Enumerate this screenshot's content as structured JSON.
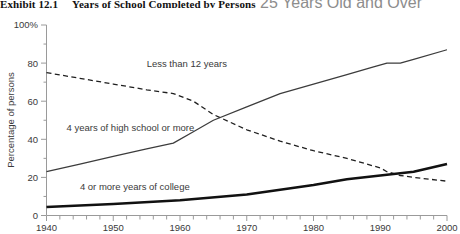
{
  "title": {
    "exhibit_number": "Exhibit 12.1",
    "text": "Years of School Completed by Persons",
    "tail": "25 Years Old and Over"
  },
  "chart_data": {
    "type": "line",
    "title": "Years of School Completed by Persons 25 Years Old and Over",
    "xlabel": "",
    "ylabel": "Percentage of persons",
    "xlim": [
      1940,
      2000
    ],
    "ylim": [
      0,
      100
    ],
    "grid": false,
    "legend_position": "inline-annotations",
    "x_tick_labels": [
      "1940",
      "1950",
      "1960",
      "1970",
      "1980",
      "1990",
      "2000"
    ],
    "x_major_ticks": [
      1940,
      1950,
      1960,
      1970,
      1980,
      1990,
      2000
    ],
    "x_minor_tick_interval": 2,
    "y_tick_labels": [
      "0",
      "20",
      "40",
      "60",
      "80",
      "100%"
    ],
    "y_major_ticks": [
      0,
      20,
      40,
      60,
      80,
      100
    ],
    "series": [
      {
        "name": "Less than 12 years",
        "style": "dashed",
        "color": "#1f1f1f",
        "label_x": 1955,
        "label_y": 80,
        "x": [
          1940,
          1945,
          1950,
          1955,
          1959,
          1962,
          1965,
          1970,
          1975,
          1980,
          1985,
          1990,
          1991,
          1993,
          1995,
          2000
        ],
        "values": [
          75,
          72,
          69,
          66,
          64,
          60,
          53,
          45,
          39,
          34,
          30,
          25,
          23,
          21,
          20,
          18
        ]
      },
      {
        "name": "4 years of high school or more",
        "style": "solid-thin",
        "color": "#3c3c3c",
        "label_x": 1943,
        "label_y": 46,
        "x": [
          1940,
          1945,
          1950,
          1955,
          1959,
          1962,
          1965,
          1970,
          1975,
          1980,
          1985,
          1989,
          1991,
          1993,
          1995,
          2000
        ],
        "values": [
          23,
          27,
          31,
          35,
          38,
          44,
          50,
          57,
          64,
          69,
          74,
          78,
          80,
          80,
          82,
          87
        ]
      },
      {
        "name": "4 or more years of college",
        "style": "solid-thick",
        "color": "#111111",
        "label_x": 1945,
        "label_y": 15,
        "x": [
          1940,
          1950,
          1960,
          1970,
          1980,
          1985,
          1990,
          1995,
          2000
        ],
        "values": [
          4.5,
          6,
          8,
          11,
          16,
          19,
          21,
          23,
          27
        ]
      }
    ]
  }
}
